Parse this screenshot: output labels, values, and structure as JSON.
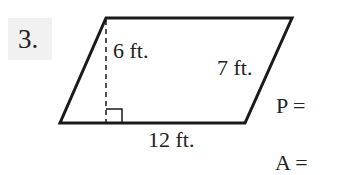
{
  "problem": {
    "number": "3.",
    "shape": "parallelogram",
    "height_label": "6 ft.",
    "side_label": "7 ft.",
    "base_label": "12 ft.",
    "perimeter_prompt": "P =",
    "area_prompt": "A ="
  }
}
